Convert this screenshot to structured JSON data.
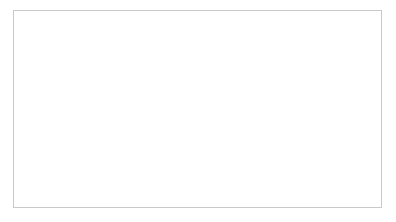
{
  "chart_data": {
    "type": "line",
    "title": "",
    "xlabel": "",
    "ylabel": "",
    "ylim": [
      0.0,
      0.3
    ],
    "yticks": [
      "0.00",
      "0.05",
      "0.10",
      "0.15",
      "0.20",
      "0.25",
      "0.30"
    ],
    "ytick_values": [
      0.0,
      0.05,
      0.1,
      0.15,
      0.2,
      0.25,
      0.3
    ],
    "grid": true,
    "legend_position": "right",
    "x": [
      1993,
      1994,
      1995,
      1996,
      1997,
      1998,
      1999,
      2000,
      2001,
      2002,
      2003,
      2004,
      2005,
      2006,
      2007
    ],
    "xtick_labels": [
      "1993",
      "1995",
      "1997",
      "1999",
      "2001",
      "2003",
      "2005",
      "2007"
    ],
    "xtick_values": [
      1993,
      1995,
      1997,
      1999,
      2001,
      2003,
      2005,
      2007
    ],
    "series": [
      {
        "name": "Ages 25-64",
        "style": "solid",
        "marker": "none",
        "color": "#1a1a1a",
        "values": [
          0.107,
          0.118,
          0.123,
          0.121,
          0.12,
          0.12,
          0.124,
          0.135,
          0.123,
          0.117,
          0.114,
          0.117,
          0.126,
          0.117,
          0.116
        ]
      },
      {
        "name": "Ages 20-24",
        "style": "dashed",
        "marker": "diamond",
        "color": "#2b2b2b",
        "values": [
          0.093,
          0.112,
          0.122,
          0.112,
          0.103,
          0.104,
          0.108,
          0.12,
          0.109,
          0.1,
          0.102,
          0.112,
          0.126,
          0.114,
          0.113
        ]
      },
      {
        "name": "Immigrants",
        "style": "dashdot",
        "marker": "none",
        "color": "#1a1a1a",
        "values": [
          0.15,
          0.172,
          0.19,
          0.186,
          0.173,
          0.16,
          0.145,
          0.152,
          0.175,
          0.196,
          0.212,
          0.224,
          0.205,
          0.175,
          0.157
        ]
      },
      {
        "name": "Single parents",
        "style": "dotted",
        "marker": "none",
        "color": "#2b2b2b",
        "values": [
          0.088,
          0.104,
          0.118,
          0.097,
          0.091,
          0.088,
          0.093,
          0.082,
          0.078,
          0.083,
          0.098,
          0.118,
          0.1,
          0.112,
          0.113
        ]
      }
    ],
    "vertical_markers": [
      1993.3,
      2002.0,
      2003.0,
      2004.5,
      2006.0
    ]
  }
}
